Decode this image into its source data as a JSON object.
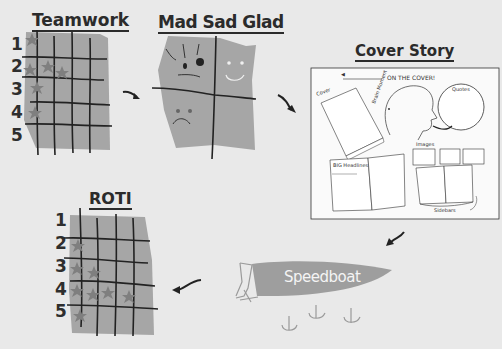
{
  "colors": {
    "background": "#e9e9e9",
    "panel_gray": "#a6a6a6",
    "star_gray": "#7f7f7f",
    "ink": "#2b2b2b",
    "speedboat_gray": "#9e9e9e"
  },
  "activities": [
    {
      "id": "teamwork",
      "title": "Teamwork",
      "rows": [
        "1",
        "2",
        "3",
        "4",
        "5"
      ],
      "stars_per_row": [
        1,
        3,
        1,
        1,
        0
      ]
    },
    {
      "id": "mad-sad-glad",
      "title": "Mad Sad Glad",
      "quadrants": [
        "mad-face",
        "glad-face",
        "sad-face",
        "empty"
      ]
    },
    {
      "id": "cover-story",
      "title": "Cover Story",
      "labels": {
        "header": "ON THE COVER!",
        "cover": "Cover",
        "brain": "Brain Moment",
        "quotes": "Quotes",
        "images": "Images",
        "headlines": "BIG Headlines",
        "sidebars": "Sidebars"
      }
    },
    {
      "id": "speedboat",
      "title": "Speedboat"
    },
    {
      "id": "roti",
      "title": "ROTI",
      "rows": [
        "1",
        "2",
        "3",
        "4",
        "5"
      ],
      "stars_per_row": [
        0,
        1,
        2,
        4,
        1
      ]
    }
  ],
  "flow_arrows": [
    "teamwork-to-mad-sad-glad",
    "mad-sad-glad-to-cover-story",
    "cover-story-to-speedboat",
    "speedboat-to-roti"
  ]
}
